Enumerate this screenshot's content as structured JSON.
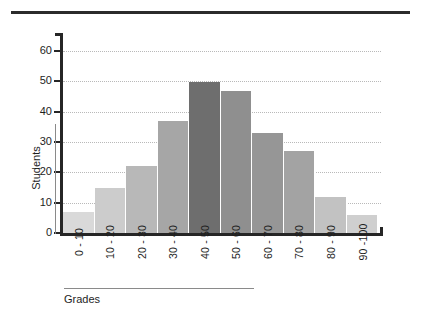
{
  "chart_data": {
    "type": "bar",
    "title": "",
    "xlabel": "Grades",
    "ylabel": "Students",
    "categories": [
      "0 - 10",
      "10 - 20",
      "20 - 30",
      "30 - 40",
      "40 - 50",
      "50 - 60",
      "60 - 70",
      "70 - 80",
      "80 - 90",
      "90 -100"
    ],
    "values": [
      7,
      15,
      22,
      37,
      50,
      47,
      33,
      27,
      12,
      6
    ],
    "bar_colors": [
      "#d9d9d9",
      "#cccccc",
      "#b8b8b8",
      "#a6a6a6",
      "#6e6e6e",
      "#8f8f8f",
      "#969696",
      "#a3a3a3",
      "#c2c2c2",
      "#cfcfcf"
    ],
    "ylim": [
      0,
      66
    ],
    "yticks": [
      0,
      10,
      20,
      30,
      40,
      50,
      60
    ],
    "ytick_labels": [
      "0",
      "10",
      "20",
      "30",
      "40",
      "50",
      "60"
    ],
    "gridlines": [
      10,
      20,
      30,
      40,
      50,
      60
    ],
    "grid": true,
    "grid_style": "dotted",
    "grid_color": "#b9b9b9",
    "legend": null,
    "legend_position": "none",
    "axis_color": "#262626",
    "text_color": "#1e1e1e",
    "background": "#ffffff",
    "xtick_label_rotation": -90,
    "top_rule_color": "#2b2b2b"
  }
}
